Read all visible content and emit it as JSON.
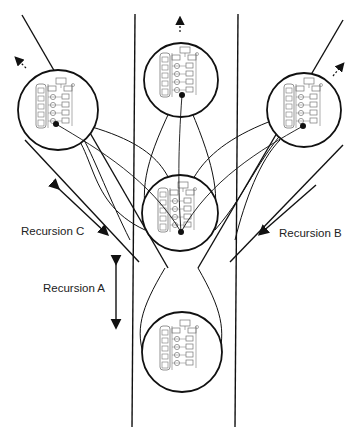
{
  "diagram": {
    "labels": {
      "recursion_a": "Recursion A",
      "recursion_b": "Recursion B",
      "recursion_c": "Recursion C"
    },
    "colors": {
      "stroke": "#111111",
      "icon": "#777777",
      "background": "#ffffff"
    },
    "nodes": [
      {
        "id": "center",
        "cx": 180,
        "cy": 213,
        "r": 38
      },
      {
        "id": "top",
        "cx": 181,
        "cy": 80,
        "r": 37
      },
      {
        "id": "left",
        "cx": 58,
        "cy": 110,
        "r": 40
      },
      {
        "id": "right",
        "cx": 304,
        "cy": 110,
        "r": 37
      },
      {
        "id": "bottom",
        "cx": 182,
        "cy": 352,
        "r": 40
      }
    ]
  }
}
